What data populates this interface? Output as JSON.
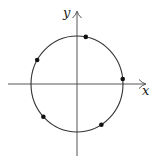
{
  "diagram": {
    "type": "unit-circle-with-points",
    "axes": {
      "x_label": "x",
      "y_label": "y"
    },
    "circle": {
      "center_px": [
        77,
        84
      ],
      "radius_px": 47
    },
    "points": [
      {
        "name": "point-1",
        "angle_deg": 79
      },
      {
        "name": "point-2",
        "angle_deg": 6
      },
      {
        "name": "point-3",
        "angle_deg": 150
      },
      {
        "name": "point-4",
        "angle_deg": 223
      },
      {
        "name": "point-5",
        "angle_deg": 302
      }
    ],
    "colors": {
      "stroke": "#333333",
      "axis": "#555555",
      "point": "#111111"
    }
  }
}
